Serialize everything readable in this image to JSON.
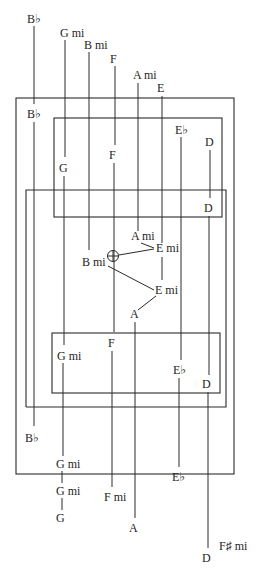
{
  "diagram": {
    "title": "",
    "colors": {
      "ink": "#2a2a2a",
      "background": "#ffffff"
    },
    "top_labels": {
      "b_flat": "B♭",
      "g_mi": "G mi",
      "b_mi": "B mi",
      "f": "F",
      "a_mi": "A mi",
      "e": "E"
    },
    "upper_box_labels": {
      "b_flat": "B♭",
      "e_flat": "E♭",
      "d": "D",
      "f": "F",
      "g": "G",
      "d2": "D"
    },
    "center_labels": {
      "a_mi": "A mi",
      "e_mi_1": "E mi",
      "b_mi": "B mi",
      "e_mi_2": "E mi",
      "a": "A"
    },
    "lower_box_labels": {
      "f": "F",
      "g_mi": "G mi",
      "e_flat": "E♭",
      "d": "D",
      "b_flat": "B♭"
    },
    "bottom_labels": {
      "g_mi_1": "G mi",
      "g_mi_2": "G mi",
      "g": "G",
      "e_flat": "E♭",
      "f_mi": "F mi",
      "a": "A",
      "d": "D",
      "f_sharp_mi": "F♯ mi"
    },
    "marker": {
      "name": "circle-crosshair",
      "near": "B mi"
    }
  }
}
